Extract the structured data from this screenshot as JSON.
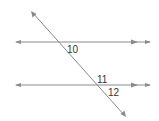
{
  "diagram": {
    "type": "parallel-lines-cut-by-transversal",
    "line_color": "#8a8a8a",
    "label_color": "#333333",
    "lines": [
      {
        "name": "upper-parallel-line",
        "x1": 15,
        "y1": 42,
        "x2": 151,
        "y2": 42,
        "parallel_mark": true
      },
      {
        "name": "lower-parallel-line",
        "x1": 15,
        "y1": 85,
        "x2": 151,
        "y2": 85,
        "parallel_mark": true
      },
      {
        "name": "transversal",
        "x1": 31,
        "y1": 11,
        "x2": 126,
        "y2": 117
      }
    ],
    "angles": [
      {
        "label": "10",
        "x": 67,
        "y": 44
      },
      {
        "label": "11",
        "x": 97,
        "y": 75
      },
      {
        "label": "12",
        "x": 108,
        "y": 88
      }
    ]
  }
}
